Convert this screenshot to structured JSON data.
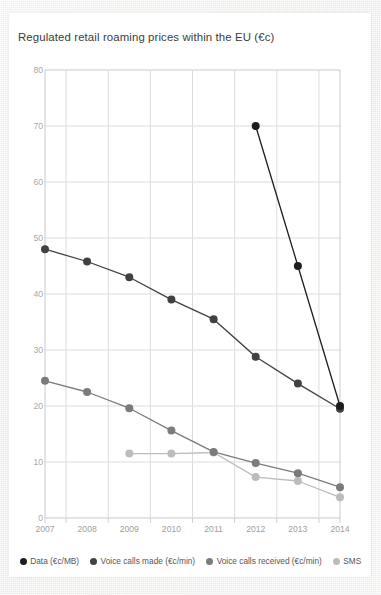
{
  "chart_data": {
    "type": "line",
    "title": "Regulated retail roaming prices within the EU (€c)",
    "xlabel": "",
    "ylabel": "",
    "categories": [
      "2007",
      "2008",
      "2009",
      "2010",
      "2011",
      "2012",
      "2013",
      "2014"
    ],
    "x": [
      2007,
      2008,
      2009,
      2010,
      2011,
      2012,
      2013,
      2014
    ],
    "ylim": [
      0,
      80
    ],
    "yticks": [
      0,
      10,
      20,
      30,
      40,
      50,
      60,
      70,
      80
    ],
    "grid": true,
    "legend_position": "bottom",
    "series": [
      {
        "name": "Data (€c/MB)",
        "color": "#1d1d1d",
        "values": [
          null,
          null,
          null,
          null,
          null,
          70,
          45,
          20
        ]
      },
      {
        "name": "Voice calls made (€c/min)",
        "color": "#414141",
        "values": [
          48,
          45.8,
          43,
          39,
          35.5,
          28.8,
          24,
          19.5
        ]
      },
      {
        "name": "Voice calls received (€c/min)",
        "color": "#7b7b7b",
        "values": [
          24.5,
          22.5,
          19.6,
          15.6,
          11.8,
          9.8,
          8,
          5.5
        ]
      },
      {
        "name": "SMS",
        "color": "#bcbcbc",
        "values": [
          null,
          null,
          11.5,
          11.5,
          11.7,
          7.3,
          6.6,
          3.7
        ]
      }
    ]
  },
  "axis": {
    "y_labels": [
      "80",
      "70",
      "60",
      "50",
      "40",
      "30",
      "20",
      "10",
      "0"
    ],
    "x_labels": [
      "2007",
      "2008",
      "2009",
      "2010",
      "2011",
      "2012",
      "2013",
      "2014"
    ]
  },
  "legend": {
    "items": [
      {
        "label": "Data (€c/MB)",
        "color": "#1d1d1d"
      },
      {
        "label": "Voice calls made (€c/min)",
        "color": "#414141"
      },
      {
        "label": "Voice calls received (€c/min)",
        "color": "#7b7b7b"
      },
      {
        "label": "SMS",
        "color": "#bcbcbc"
      }
    ]
  },
  "footer": {
    "corner_mark": ""
  }
}
